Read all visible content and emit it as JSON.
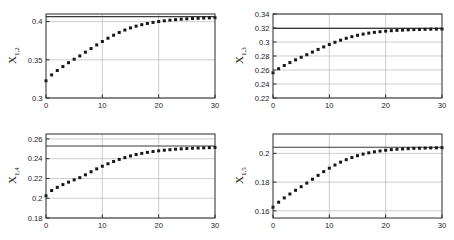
{
  "figure": {
    "background": "#ffffff",
    "axis_color": "#2b2b2b",
    "grid_color": "#b9b9b9",
    "marker_color": "#171717",
    "refline_color": "#3a3a3a",
    "rows": 2,
    "cols": 2
  },
  "chart_data": [
    {
      "type": "scatter",
      "id": "panel-x12",
      "position": "top-left",
      "title": "",
      "xlabel": "",
      "ylabel": "X_{1,2}",
      "ylabel_base": "X",
      "ylabel_sub": "1,2",
      "xlim": [
        0,
        30
      ],
      "ylim": [
        0.3,
        0.41
      ],
      "xticks": [
        0,
        10,
        20,
        30
      ],
      "xticklabels": [
        "0",
        "10",
        "20",
        "30"
      ],
      "yticks": [
        0.3,
        0.35,
        0.4
      ],
      "yticklabels": [
        "0.3",
        "0.35",
        "0.4"
      ],
      "grid": true,
      "legend": "none",
      "reference_line": 0.4065,
      "series": [
        {
          "name": "X_1,2 estimate",
          "marker": "square-dot",
          "x": [
            0,
            1,
            2,
            3,
            4,
            5,
            6,
            7,
            8,
            9,
            10,
            11,
            12,
            13,
            14,
            15,
            16,
            17,
            18,
            19,
            20,
            21,
            22,
            23,
            24,
            25,
            26,
            27,
            28,
            29,
            30
          ],
          "y": [
            0.3225,
            0.3302,
            0.336,
            0.3412,
            0.3462,
            0.3508,
            0.3551,
            0.36,
            0.3648,
            0.3695,
            0.374,
            0.3783,
            0.3822,
            0.3858,
            0.389,
            0.3918,
            0.3941,
            0.396,
            0.3976,
            0.399,
            0.4001,
            0.4011,
            0.4019,
            0.4026,
            0.4032,
            0.4037,
            0.4041,
            0.4044,
            0.4047,
            0.4049,
            0.4051
          ]
        }
      ]
    },
    {
      "type": "scatter",
      "id": "panel-x13",
      "position": "top-right",
      "title": "",
      "xlabel": "",
      "ylabel": "X_{1,3}",
      "ylabel_base": "X",
      "ylabel_sub": "1,3",
      "xlim": [
        0,
        30
      ],
      "ylim": [
        0.22,
        0.34
      ],
      "xticks": [
        0,
        10,
        20,
        30
      ],
      "xticklabels": [
        "0",
        "10",
        "20",
        "30"
      ],
      "yticks": [
        0.22,
        0.24,
        0.26,
        0.28,
        0.3,
        0.32,
        0.34
      ],
      "yticklabels": [
        "0.22",
        "0.24",
        "0.26",
        "0.28",
        "0.3",
        "0.32",
        "0.34"
      ],
      "grid": true,
      "legend": "none",
      "reference_line": 0.3195,
      "series": [
        {
          "name": "X_1,3 estimate",
          "marker": "square-dot",
          "x": [
            0,
            1,
            2,
            3,
            4,
            5,
            6,
            7,
            8,
            9,
            10,
            11,
            12,
            13,
            14,
            15,
            16,
            17,
            18,
            19,
            20,
            21,
            22,
            23,
            24,
            25,
            26,
            27,
            28,
            29,
            30
          ],
          "y": [
            0.256,
            0.2618,
            0.2664,
            0.2706,
            0.2745,
            0.2782,
            0.2818,
            0.2856,
            0.2894,
            0.293,
            0.2964,
            0.2996,
            0.3026,
            0.3053,
            0.3076,
            0.3096,
            0.3113,
            0.3127,
            0.3138,
            0.3147,
            0.3155,
            0.3161,
            0.3166,
            0.317,
            0.3174,
            0.3177,
            0.3179,
            0.3181,
            0.3183,
            0.3184,
            0.3185
          ]
        }
      ]
    },
    {
      "type": "scatter",
      "id": "panel-x14",
      "position": "bottom-left",
      "title": "",
      "xlabel": "",
      "ylabel": "X_{1,4}",
      "ylabel_base": "X",
      "ylabel_sub": "1,4",
      "xlim": [
        0,
        30
      ],
      "ylim": [
        0.18,
        0.265
      ],
      "xticks": [
        0,
        10,
        20,
        30
      ],
      "xticklabels": [
        "0",
        "10",
        "20",
        "30"
      ],
      "yticks": [
        0.18,
        0.2,
        0.22,
        0.24,
        0.26
      ],
      "yticklabels": [
        "0.18",
        "0.2",
        "0.22",
        "0.24",
        "0.26"
      ],
      "grid": true,
      "legend": "none",
      "reference_line": 0.2528,
      "series": [
        {
          "name": "X_1,4 estimate",
          "marker": "square-dot",
          "x": [
            0,
            1,
            2,
            3,
            4,
            5,
            6,
            7,
            8,
            9,
            10,
            11,
            12,
            13,
            14,
            15,
            16,
            17,
            18,
            19,
            20,
            21,
            22,
            23,
            24,
            25,
            26,
            27,
            28,
            29,
            30
          ],
          "y": [
            0.2025,
            0.2078,
            0.211,
            0.2138,
            0.2163,
            0.2186,
            0.2208,
            0.2237,
            0.2268,
            0.2297,
            0.2324,
            0.2349,
            0.2372,
            0.2393,
            0.2411,
            0.2428,
            0.2442,
            0.2454,
            0.2464,
            0.2473,
            0.248,
            0.2486,
            0.2491,
            0.2496,
            0.25,
            0.2503,
            0.2506,
            0.2508,
            0.251,
            0.2512,
            0.2514
          ]
        }
      ]
    },
    {
      "type": "scatter",
      "id": "panel-x15",
      "position": "bottom-right",
      "title": "",
      "xlabel": "",
      "ylabel": "X_{1,5}",
      "ylabel_base": "X",
      "ylabel_sub": "1,5",
      "xlim": [
        0,
        30
      ],
      "ylim": [
        0.155,
        0.2135
      ],
      "xticks": [
        0,
        10,
        20,
        30
      ],
      "xticklabels": [
        "0",
        "10",
        "20",
        "30"
      ],
      "yticks": [
        0.16,
        0.18,
        0.2
      ],
      "yticklabels": [
        "0.16",
        "0.18",
        "0.2"
      ],
      "grid": true,
      "legend": "none",
      "reference_line": 0.2043,
      "series": [
        {
          "name": "X_1,5 estimate",
          "marker": "square-dot",
          "x": [
            0,
            1,
            2,
            3,
            4,
            5,
            6,
            7,
            8,
            9,
            10,
            11,
            12,
            13,
            14,
            15,
            16,
            17,
            18,
            19,
            20,
            21,
            22,
            23,
            24,
            25,
            26,
            27,
            28,
            29,
            30
          ],
          "y": [
            0.1625,
            0.166,
            0.169,
            0.1717,
            0.1743,
            0.1768,
            0.1793,
            0.182,
            0.1847,
            0.1873,
            0.1897,
            0.1919,
            0.1939,
            0.1956,
            0.1971,
            0.1984,
            0.1995,
            0.2004,
            0.2011,
            0.2017,
            0.2022,
            0.2026,
            0.2029,
            0.2031,
            0.2033,
            0.2035,
            0.2036,
            0.2037,
            0.2038,
            0.2039,
            0.204
          ]
        }
      ]
    }
  ]
}
